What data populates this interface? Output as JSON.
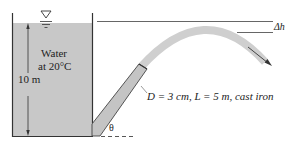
{
  "diagram": {
    "fluid_label_line1": "Water",
    "fluid_label_line2": "at 20°C",
    "height_label": "10 m",
    "pipe_label": "D = 3 cm, L = 5 m, cast iron",
    "angle_label": "θ",
    "delta_h_label": "Δh",
    "colors": {
      "water": "#c8c8c8",
      "pipe": "#c4c4c4",
      "jet": "#cfcfcf",
      "lines": "#333333"
    }
  }
}
